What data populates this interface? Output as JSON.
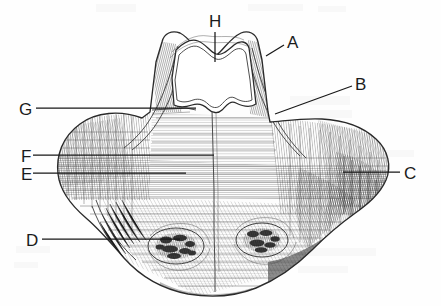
{
  "figure": {
    "kind": "anatomical-engraving",
    "caption": "",
    "background_color": "#fefefe",
    "ink_color": "#1b1b1b"
  },
  "labels": [
    {
      "id": "H",
      "text": "H",
      "x": 209,
      "y": 27,
      "leader": {
        "type": "vertical",
        "x1": 215,
        "y1": 32,
        "x2": 215,
        "y2": 62
      }
    },
    {
      "id": "A",
      "text": "A",
      "x": 287,
      "y": 48,
      "leader": {
        "type": "diagonal",
        "x1": 284,
        "y1": 45,
        "x2": 266,
        "y2": 56
      }
    },
    {
      "id": "B",
      "text": "B",
      "x": 355,
      "y": 90,
      "leader": {
        "type": "diagonal",
        "x1": 352,
        "y1": 86,
        "x2": 275,
        "y2": 114
      }
    },
    {
      "id": "G",
      "text": "G",
      "x": 19,
      "y": 115,
      "leader": {
        "type": "horizontal",
        "x1": 36,
        "y1": 108,
        "x2": 196,
        "y2": 108
      }
    },
    {
      "id": "F",
      "text": "F",
      "x": 21,
      "y": 162,
      "leader": {
        "type": "horizontal",
        "x1": 33,
        "y1": 155,
        "x2": 214,
        "y2": 155
      }
    },
    {
      "id": "E",
      "text": "E",
      "x": 21,
      "y": 180,
      "leader": {
        "type": "horizontal",
        "x1": 33,
        "y1": 173,
        "x2": 186,
        "y2": 173
      }
    },
    {
      "id": "C",
      "text": "C",
      "x": 404,
      "y": 179,
      "leader": {
        "type": "horizontal",
        "x1": 343,
        "y1": 172,
        "x2": 400,
        "y2": 172
      }
    },
    {
      "id": "D",
      "text": "D",
      "x": 26,
      "y": 246,
      "leader": {
        "type": "horizontal",
        "x1": 42,
        "y1": 239,
        "x2": 180,
        "y2": 239
      }
    }
  ],
  "specimen": {
    "name": "bone-specimen",
    "outline_description": "broad winged bone with central superior notch and paired inferior tubercles",
    "midline_suture": true,
    "foramen_count": 1,
    "tubercle_count": 2
  }
}
